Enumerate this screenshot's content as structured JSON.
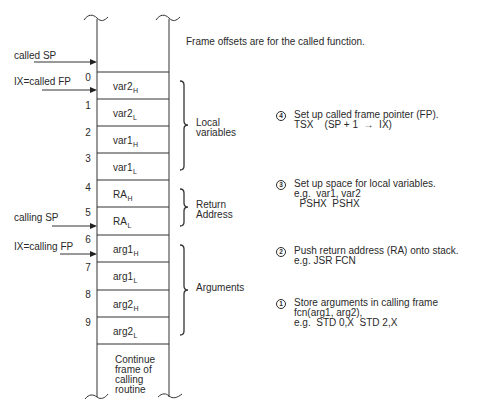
{
  "caption": "Frame offsets are for the called function.",
  "pointers": [
    {
      "label": "called SP"
    },
    {
      "label": "IX=called FP"
    },
    {
      "label": "calling SP"
    },
    {
      "label": "IX=calling FP"
    }
  ],
  "stack": {
    "rows": [
      {
        "offset": "0",
        "base": "var2",
        "sub": "H"
      },
      {
        "offset": "1",
        "base": "var2",
        "sub": "L"
      },
      {
        "offset": "2",
        "base": "var1",
        "sub": "H"
      },
      {
        "offset": "3",
        "base": "var1",
        "sub": "L"
      },
      {
        "offset": "4",
        "base": "RA",
        "sub": "H"
      },
      {
        "offset": "5",
        "base": "RA",
        "sub": "L"
      },
      {
        "offset": "6",
        "base": "arg1",
        "sub": "H"
      },
      {
        "offset": "7",
        "base": "arg1",
        "sub": "L"
      },
      {
        "offset": "8",
        "base": "arg2",
        "sub": "H"
      },
      {
        "offset": "9",
        "base": "arg2",
        "sub": "L"
      }
    ],
    "continuation": [
      "Continue",
      "frame of",
      "calling",
      "routine"
    ]
  },
  "groups": [
    {
      "name": "local-variables",
      "lines": [
        "Local",
        "variables"
      ]
    },
    {
      "name": "return-address",
      "lines": [
        "Return",
        "Address"
      ]
    },
    {
      "name": "arguments",
      "lines": [
        "Arguments"
      ]
    }
  ],
  "steps": [
    {
      "number": "4",
      "lines": [
        "Set up called frame pointer (FP).",
        "TSX    (SP + 1  →  IX)"
      ]
    },
    {
      "number": "3",
      "lines": [
        "Set up space for local variables.",
        "e.g.  var1, var2",
        "  PSHX  PSHX"
      ]
    },
    {
      "number": "2",
      "lines": [
        "Push return address (RA) onto stack.",
        "e.g. JSR FCN"
      ]
    },
    {
      "number": "1",
      "lines": [
        "Store arguments in calling frame",
        "fcn(arg1, arg2),",
        "e.g.  STD 0,X  STD 2,X"
      ]
    }
  ],
  "colors": {
    "ink": "#2a2a2a",
    "background": "#ffffff"
  }
}
